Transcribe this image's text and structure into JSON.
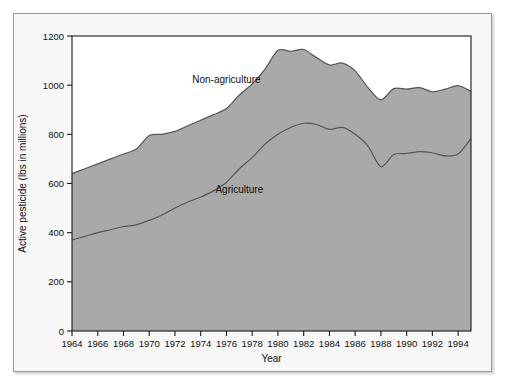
{
  "chart_data": {
    "type": "area",
    "stacked": true,
    "title": "",
    "xlabel": "Year",
    "ylabel": "Active pesticide (lbs in millions)",
    "xlim": [
      1964,
      1995
    ],
    "ylim": [
      0,
      1200
    ],
    "yticks": [
      0,
      200,
      400,
      600,
      800,
      1000,
      1200
    ],
    "ytick_labels": [
      "0",
      "200",
      "400",
      "600",
      "800",
      "1000",
      "1200"
    ],
    "xticks": [
      1964,
      1966,
      1968,
      1970,
      1972,
      1974,
      1976,
      1978,
      1980,
      1982,
      1984,
      1986,
      1988,
      1990,
      1992,
      1994
    ],
    "xtick_labels": [
      "1964",
      "1966",
      "1968",
      "1970",
      "1972",
      "1974",
      "1976",
      "1978",
      "1980",
      "1982",
      "1984",
      "1986",
      "1988",
      "1990",
      "1992",
      "1994"
    ],
    "grid": false,
    "legend_position": "inline-annotation",
    "x": [
      1964,
      1965,
      1966,
      1967,
      1968,
      1969,
      1970,
      1971,
      1972,
      1973,
      1974,
      1975,
      1976,
      1977,
      1978,
      1979,
      1980,
      1981,
      1982,
      1983,
      1984,
      1985,
      1986,
      1987,
      1988,
      1989,
      1990,
      1991,
      1992,
      1993,
      1994,
      1995
    ],
    "series": [
      {
        "name": "Agriculture",
        "annotation": "Agriculture",
        "fill_color": "#a9a9a9",
        "line_color": "#555555",
        "values": [
          370,
          385,
          400,
          412,
          425,
          432,
          450,
          472,
          500,
          525,
          545,
          570,
          605,
          660,
          705,
          760,
          800,
          828,
          845,
          840,
          820,
          828,
          800,
          752,
          668,
          718,
          722,
          730,
          725,
          712,
          720,
          782
        ]
      },
      {
        "name": "Non-agriculture",
        "annotation": "Non-agriculture",
        "fill_color": "#a9a9a9",
        "line_color": "#555555",
        "values": [
          270,
          275,
          280,
          288,
          295,
          308,
          345,
          328,
          312,
          310,
          312,
          310,
          300,
          300,
          300,
          305,
          342,
          310,
          300,
          272,
          262,
          262,
          258,
          238,
          272,
          268,
          262,
          260,
          248,
          272,
          278,
          193
        ]
      }
    ],
    "total_values": [
      640,
      660,
      680,
      700,
      720,
      740,
      795,
      800,
      812,
      835,
      857,
      880,
      905,
      960,
      1005,
      1065,
      1142,
      1138,
      1145,
      1112,
      1082,
      1090,
      1058,
      990,
      940,
      986,
      984,
      990,
      973,
      984,
      998,
      975
    ],
    "annotations": [
      {
        "text": "Non-agriculture",
        "x": 1976,
        "y": 1010
      },
      {
        "text": "Agriculture",
        "x": 1977,
        "y": 560
      }
    ],
    "colors": {
      "area_fill": "#a9a9a9",
      "curve_line": "#555555",
      "axis": "#1a1a1a",
      "plot_background": "#ffffff",
      "figure_background": "#f7f7f7",
      "frame_border": "#9a9a9a",
      "text": "#101010"
    }
  }
}
